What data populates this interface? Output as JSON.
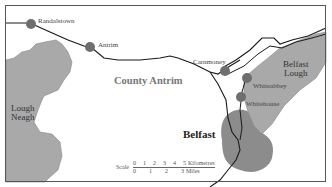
{
  "map": {
    "region_label": "County Antrim",
    "city_label": "Belfast",
    "water_bodies": [
      {
        "name": "Lough Neagh",
        "line1": "Lough",
        "line2": "Neagh"
      },
      {
        "name": "Belfast Lough",
        "line1": "Belfast",
        "line2": "Lough"
      }
    ],
    "towns": [
      {
        "name": "Randalstown"
      },
      {
        "name": "Antrim"
      },
      {
        "name": "Carnmoney"
      },
      {
        "name": "Whiteabbey"
      },
      {
        "name": "Whitehouse"
      }
    ],
    "colors": {
      "border": "#555555",
      "road": "#1a1a1a",
      "water": "#a9a9a9",
      "city_area": "#8c8c8c",
      "town_marker": "#6e6e6e"
    }
  },
  "scale": {
    "label": "Scale",
    "km_ticks": [
      "0",
      "1",
      "2",
      "3",
      "4",
      "5"
    ],
    "km_unit": "Kilometres",
    "mile_ticks": [
      "0",
      "1",
      "2",
      "3"
    ],
    "mile_unit": "Miles"
  }
}
